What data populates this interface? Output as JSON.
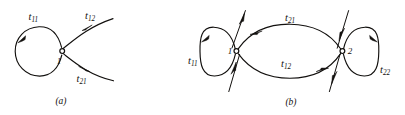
{
  "figure": {
    "background_color": "#ffffff",
    "ink_color": "#12100e",
    "panels": [
      {
        "id": "a",
        "caption": "(a)",
        "node_labels": [
          "1"
        ],
        "edge_labels": [
          "t11",
          "t12",
          "t21"
        ],
        "edges": [
          {
            "name": "self-loop",
            "label": "t11",
            "sub": "11",
            "direction": "counterclockwise"
          },
          {
            "name": "outgoing",
            "label": "t12",
            "sub": "12",
            "direction": "away-from-node"
          },
          {
            "name": "incoming",
            "label": "t21",
            "sub": "21",
            "direction": "toward-node"
          }
        ]
      },
      {
        "id": "b",
        "caption": "(b)",
        "node_labels": [
          "1",
          "2"
        ],
        "edge_labels": [
          "t11",
          "t21",
          "t12",
          "t22"
        ],
        "edges": [
          {
            "name": "self-loop-node1",
            "label": "t11",
            "sub": "11",
            "direction": "counterclockwise"
          },
          {
            "name": "top-edge",
            "label": "t21",
            "sub": "21",
            "direction": "node2-to-node1"
          },
          {
            "name": "bottom-edge",
            "label": "t12",
            "sub": "12",
            "direction": "node1-to-node2"
          },
          {
            "name": "self-loop-node2",
            "label": "t22",
            "sub": "22",
            "direction": "clockwise"
          }
        ]
      }
    ],
    "labels": {
      "a_t11": {
        "base": "t",
        "sub": "11"
      },
      "a_t12": {
        "base": "t",
        "sub": "12"
      },
      "a_t21": {
        "base": "t",
        "sub": "21"
      },
      "a_node1": "1",
      "a_caption": "(a)",
      "b_t11": {
        "base": "t",
        "sub": "11"
      },
      "b_t21": {
        "base": "t",
        "sub": "21"
      },
      "b_t12": {
        "base": "t",
        "sub": "12"
      },
      "b_t22": {
        "base": "t",
        "sub": "22"
      },
      "b_node1": "1",
      "b_node2": "2",
      "b_caption": "(b)"
    }
  }
}
